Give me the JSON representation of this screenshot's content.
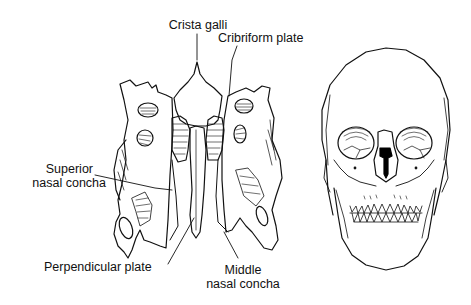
{
  "figure": {
    "type": "anatomical-illustration",
    "panels": [
      {
        "name": "ethmoid-bone",
        "view": "anterior"
      },
      {
        "name": "skull",
        "view": "anterior"
      }
    ]
  },
  "labels": {
    "crista_galli": "Crista galli",
    "cribriform_plate": "Cribriform plate",
    "superior_nasal_concha_line1": "Superior",
    "superior_nasal_concha_line2": "nasal concha",
    "perpendicular_plate": "Perpendicular plate",
    "middle_nasal_concha_line1": "Middle",
    "middle_nasal_concha_line2": "nasal concha"
  },
  "colors": {
    "line": "#111111",
    "background": "#ffffff",
    "highlight": "#000000"
  }
}
